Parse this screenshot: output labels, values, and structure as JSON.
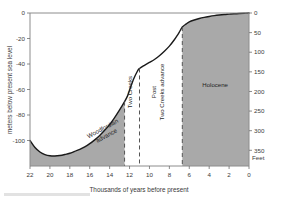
{
  "chart_data": {
    "type": "line",
    "title": "",
    "subtitle": "",
    "xlabel": "Thousands of years before present",
    "ylabel": "meters below present sea level",
    "y2label": "Feet",
    "xlim": [
      22,
      0
    ],
    "ylim": [
      -120,
      0
    ],
    "y2lim": [
      390,
      0
    ],
    "x_reversed": true,
    "grid": false,
    "legend": null,
    "xticks": [
      22,
      20,
      18,
      16,
      14,
      12,
      10,
      8,
      6,
      4,
      2,
      0
    ],
    "xtick_labels": [
      "22",
      "20",
      "18",
      "16",
      "14",
      "12",
      "10",
      "8",
      "6",
      "4",
      "2",
      "0"
    ],
    "yticks": [
      0,
      -20,
      -40,
      -60,
      -80,
      -100
    ],
    "ytick_labels": [
      "0",
      "-20",
      "-40",
      "-60",
      "-80",
      "-100"
    ],
    "y2ticks": [
      0,
      50,
      100,
      150,
      200,
      250,
      300,
      350
    ],
    "y2tick_labels": [
      "0",
      "50",
      "100",
      "150",
      "200",
      "250",
      "300",
      "350"
    ],
    "series": [
      {
        "name": "sea level",
        "x": [
          22.0,
          21.5,
          21.0,
          20.5,
          20.0,
          19.5,
          19.0,
          18.5,
          18.0,
          17.5,
          17.0,
          16.5,
          16.0,
          15.5,
          15.0,
          14.5,
          14.0,
          13.5,
          13.0,
          12.5,
          12.2,
          12.0,
          11.6,
          11.2,
          11.0,
          10.5,
          10.0,
          9.5,
          9.0,
          8.5,
          8.0,
          7.5,
          7.2,
          7.0,
          6.7,
          6.3,
          6.0,
          5.5,
          5.0,
          4.5,
          4.0,
          3.5,
          3.0,
          2.5,
          2.0,
          1.5,
          1.0,
          0.5,
          0.0
        ],
        "y": [
          -100.0,
          -105.5,
          -109.0,
          -111.0,
          -112.0,
          -112.2,
          -111.8,
          -111.0,
          -110.0,
          -108.5,
          -107.0,
          -105.0,
          -102.5,
          -99.5,
          -96.0,
          -92.0,
          -87.5,
          -82.0,
          -76.0,
          -69.5,
          -65.0,
          -60.5,
          -52.0,
          -45.5,
          -43.5,
          -41.0,
          -38.8,
          -36.5,
          -33.5,
          -30.0,
          -26.0,
          -21.0,
          -17.5,
          -15.0,
          -11.0,
          -8.5,
          -7.0,
          -5.5,
          -4.3,
          -3.4,
          -2.7,
          -2.1,
          -1.6,
          -1.2,
          -0.9,
          -0.6,
          -0.35,
          -0.15,
          0.0
        ]
      }
    ],
    "shaded_regions": [
      {
        "name": "Woodfordian advance",
        "x_start": 22.0,
        "x_end": 12.5,
        "label": "Woodfordian\nadvance",
        "fill": "#a9a9a9"
      },
      {
        "name": "Holocene",
        "x_start": 6.7,
        "x_end": 0.0,
        "label": "Holocene",
        "fill": "#a9a9a9"
      }
    ],
    "dividers": [
      {
        "name": "woodfordian-end",
        "x": 12.5
      },
      {
        "name": "two-creeks-end",
        "x": 11.0
      },
      {
        "name": "holocene-start",
        "x": 6.7
      }
    ],
    "annotations": [
      {
        "name": "woodfordian-advance-label",
        "text_line1": "Woodfordian",
        "text_line2": "advance",
        "x": 14.6,
        "y": -92,
        "rotation": -28
      },
      {
        "name": "two-creeks-label",
        "text": "Two Creeks",
        "x": 11.8,
        "y": -62,
        "rotation": -90
      },
      {
        "name": "post-two-creeks-label",
        "text_line1": "Post",
        "text_line2": "Two Creeks advance",
        "x": 9.3,
        "y": -62,
        "rotation": -90
      },
      {
        "name": "holocene-label",
        "text": "Holocene",
        "x": 3.4,
        "y": -58,
        "rotation": 0
      }
    ]
  },
  "colors": {
    "fill_gray": "#a9a9a9",
    "curve": "#1a1a1a",
    "axis": "#8c8c8c",
    "divider": "#555555",
    "text": "#3a3a3a",
    "background": "#ffffff"
  }
}
